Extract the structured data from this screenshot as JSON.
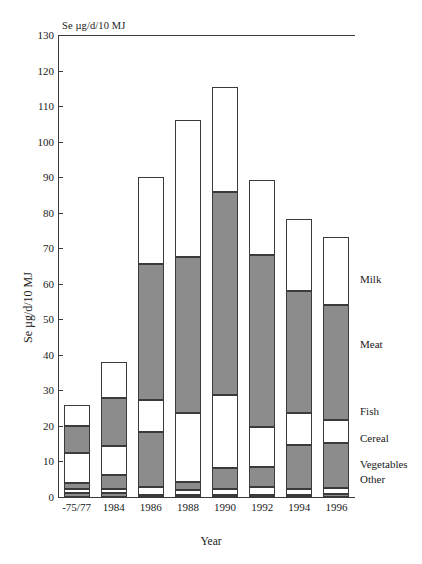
{
  "chart_data": {
    "type": "bar",
    "title": "",
    "unit_caption": "Se µg/d/10 MJ",
    "xlabel": "Year",
    "ylabel": "Se µg/d/10 MJ",
    "ylim": [
      0,
      130
    ],
    "ytick_step": 10,
    "yticks": [
      0,
      10,
      20,
      30,
      40,
      50,
      60,
      70,
      80,
      90,
      100,
      110,
      120,
      130
    ],
    "grid": false,
    "stacked": true,
    "legend_position": "right-outside",
    "categories": [
      "-75/77",
      "1984",
      "1986",
      "1988",
      "1990",
      "1992",
      "1994",
      "1996"
    ],
    "series": [
      {
        "name": "Other",
        "fill": "gray",
        "values": [
          1.0,
          1.0,
          0.6,
          0.6,
          0.6,
          0.6,
          0.6,
          0.8
        ]
      },
      {
        "name": "Vegetables",
        "fill": "white",
        "values": [
          1.2,
          1.3,
          2.2,
          1.3,
          1.7,
          2.2,
          1.7,
          1.7
        ]
      },
      {
        "name": "Cereal",
        "fill": "gray",
        "values": [
          1.8,
          3.9,
          15.5,
          2.2,
          5.9,
          5.6,
          12.3,
          12.7
        ]
      },
      {
        "name": "Fish",
        "fill": "white",
        "values": [
          8.5,
          8.2,
          9.0,
          19.5,
          20.5,
          11.4,
          9.0,
          6.6
        ]
      },
      {
        "name": "Meat",
        "fill": "gray",
        "values": [
          7.4,
          13.6,
          38.3,
          43.8,
          57.1,
          48.4,
          34.4,
          32.3
        ]
      },
      {
        "name": "Milk",
        "fill": "white",
        "values": [
          6.1,
          10.0,
          24.4,
          38.6,
          29.7,
          21.0,
          20.3,
          19.1
        ]
      }
    ],
    "totals": [
      26.0,
      38.0,
      90.0,
      106.0,
      115.5,
      89.2,
      78.3,
      73.2
    ],
    "legend_labels": [
      "Milk",
      "Meat",
      "Fish",
      "Cereal",
      "Vegetables",
      "Other"
    ],
    "colors": {
      "gray_fill": "#8c8c8c",
      "white_fill": "#ffffff",
      "outline": "#3a3a3a"
    }
  }
}
